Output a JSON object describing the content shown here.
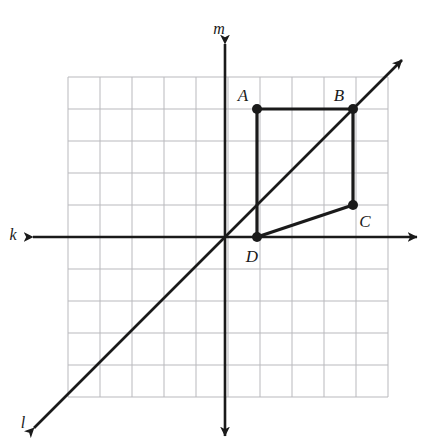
{
  "figure": {
    "title_fragment": "",
    "background_color": "#ffffff",
    "grid": {
      "color": "#b9b9bd",
      "cell_size_px": 32,
      "columns": 10,
      "rows": 10,
      "left_px": 68,
      "top_px": 77,
      "origin_x_px": 225,
      "origin_y_px": 237,
      "units_left": 5,
      "units_right": 5,
      "units_up": 5,
      "units_down": 5
    },
    "axis_color": "#1a1a1a",
    "shape_color": "#1a1a1a",
    "lines": [
      {
        "name": "k",
        "label": "k",
        "kind": "horizontal-axis",
        "label_x_px": 13,
        "label_y_px": 239,
        "arrow_start_px": [
          33,
          237
        ],
        "arrow_end_px": [
          417,
          237
        ],
        "double_arrow": true
      },
      {
        "name": "m",
        "label": "m",
        "kind": "vertical-axis",
        "label_x_px": 218,
        "label_y_px": 33,
        "arrow_start_px": [
          225,
          44
        ],
        "arrow_end_px": [
          225,
          436
        ],
        "double_arrow": true
      },
      {
        "name": "l",
        "label": "l",
        "kind": "diagonal-line-y-equals-x",
        "label_x_px": 22,
        "label_y_px": 427,
        "arrow_start_px": [
          34,
          428
        ],
        "arrow_end_px": [
          402,
          60
        ],
        "double_arrow": true
      }
    ],
    "points": [
      {
        "name": "A",
        "label": "A",
        "grid_x": 1,
        "grid_y": 4,
        "px": [
          257,
          109
        ],
        "label_px": [
          243,
          101
        ]
      },
      {
        "name": "B",
        "label": "B",
        "grid_x": 4,
        "grid_y": 4,
        "px": [
          353,
          109
        ],
        "label_px": [
          339,
          101
        ]
      },
      {
        "name": "C",
        "label": "C",
        "grid_x": 4,
        "grid_y": 1,
        "px": [
          353,
          205
        ],
        "label_px": [
          359,
          227
        ]
      },
      {
        "name": "D",
        "label": "D",
        "grid_x": 1,
        "grid_y": 0,
        "px": [
          257,
          237
        ],
        "label_px": [
          250,
          262
        ]
      }
    ],
    "polygon": {
      "name": "quadrilateral-ABCD",
      "vertex_order": [
        "A",
        "B",
        "C",
        "D"
      ],
      "closed": true,
      "stroke_width_px": 3.2,
      "dot_radius_px": 5
    }
  },
  "chart_data": {
    "type": "scatter",
    "xlabel": "k",
    "ylabel": "m",
    "xlim": [
      -5,
      5
    ],
    "ylim": [
      -5,
      5
    ],
    "grid": true,
    "legend": "none",
    "series": [
      {
        "name": "Quadrilateral ABCD",
        "labels": [
          "A",
          "B",
          "C",
          "D"
        ],
        "x": [
          1,
          4,
          4,
          1
        ],
        "y": [
          4,
          4,
          1,
          0
        ]
      }
    ],
    "annotations": [
      {
        "text": "k",
        "meaning": "horizontal axis (x-axis)"
      },
      {
        "text": "m",
        "meaning": "vertical axis (y-axis)"
      },
      {
        "text": "l",
        "meaning": "line y = x, diagonal through origin"
      }
    ]
  }
}
